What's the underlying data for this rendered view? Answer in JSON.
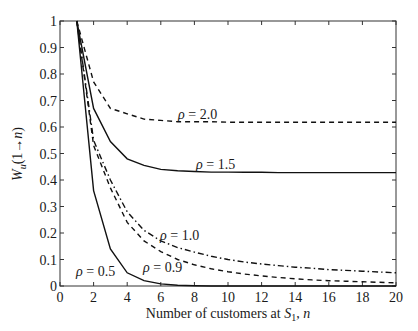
{
  "chart_data": {
    "type": "line",
    "title": "",
    "xlabel": "Number of customers at S_1, n",
    "xlabel_parts": {
      "pre": "Number of customers at ",
      "var": "S",
      "sub": "1",
      "post": ", n"
    },
    "ylabel": "W_u(1→n)",
    "ylabel_parts": {
      "var": "W",
      "sub": "u",
      "rest": "(1→n)"
    },
    "xlim": [
      0,
      20
    ],
    "ylim": [
      0,
      1
    ],
    "xticks": [
      0,
      2,
      4,
      6,
      8,
      10,
      12,
      14,
      16,
      18,
      20
    ],
    "yticks": [
      0,
      0.1,
      0.2,
      0.3,
      0.4,
      0.5,
      0.6,
      0.7,
      0.8,
      0.9,
      1
    ],
    "ytick_labels": [
      "0",
      "0.1",
      "0.2",
      "0.3",
      "0.4",
      "0.5",
      "0.6",
      "0.7",
      "0.8",
      "0.9",
      "1"
    ],
    "grid": false,
    "legend": "inline labels",
    "x": [
      1,
      2,
      3,
      4,
      5,
      6,
      7,
      8,
      9,
      10,
      11,
      12,
      13,
      14,
      15,
      16,
      17,
      18,
      19,
      20
    ],
    "series": [
      {
        "name": "ρ = 2.0",
        "style": "dashed",
        "values": [
          1.0,
          0.77,
          0.67,
          0.65,
          0.63,
          0.625,
          0.62,
          0.62,
          0.62,
          0.618,
          0.618,
          0.618,
          0.618,
          0.618,
          0.618,
          0.618,
          0.618,
          0.618,
          0.618,
          0.618
        ],
        "label_pos": [
          178,
          119
        ]
      },
      {
        "name": "ρ = 1.5",
        "style": "solid",
        "values": [
          1.0,
          0.67,
          0.545,
          0.48,
          0.455,
          0.44,
          0.435,
          0.432,
          0.43,
          0.43,
          0.429,
          0.429,
          0.428,
          0.428,
          0.428,
          0.428,
          0.428,
          0.428,
          0.428,
          0.428
        ],
        "label_pos": [
          196,
          169
        ]
      },
      {
        "name": "ρ = 1.0",
        "style": "dashdot",
        "values": [
          1.0,
          0.55,
          0.4,
          0.28,
          0.21,
          0.17,
          0.145,
          0.128,
          0.112,
          0.1,
          0.09,
          0.083,
          0.077,
          0.071,
          0.067,
          0.062,
          0.059,
          0.056,
          0.053,
          0.05
        ],
        "label_pos": [
          160,
          240
        ]
      },
      {
        "name": "ρ = 0.9",
        "style": "dashed",
        "values": [
          1.0,
          0.53,
          0.37,
          0.24,
          0.17,
          0.13,
          0.1,
          0.08,
          0.065,
          0.054,
          0.045,
          0.038,
          0.032,
          0.027,
          0.023,
          0.02,
          0.018,
          0.016,
          0.014,
          0.012
        ],
        "label_pos": [
          143,
          272
        ]
      },
      {
        "name": "ρ = 0.5",
        "style": "solid",
        "values": [
          1.0,
          0.36,
          0.14,
          0.05,
          0.02,
          0.008,
          0.003,
          0.001,
          0.0,
          0.0,
          0.0,
          0.0,
          0.0,
          0.0,
          0.0,
          0.0,
          0.0,
          0.0,
          0.0,
          0.0
        ],
        "label_pos": [
          76,
          276
        ]
      }
    ]
  }
}
